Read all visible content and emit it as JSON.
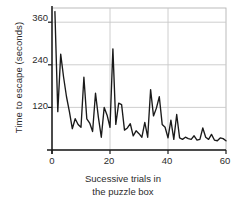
{
  "chart_data": {
    "type": "line",
    "title": "",
    "xlabel": "Sucessive trials in the puzzle box",
    "xlabel_line1": "Sucessive trials in",
    "xlabel_line2": "the puzzle box",
    "ylabel": "Time to escape (seconds)",
    "xlim": [
      0,
      60
    ],
    "ylim": [
      0,
      400
    ],
    "xticks": [
      0,
      20,
      40,
      60
    ],
    "yticks": [
      120,
      240,
      360
    ],
    "xtick_labels": [
      "0",
      "20",
      "40",
      "60"
    ],
    "ytick_labels": [
      "120",
      "240",
      "360"
    ],
    "grid": true,
    "legend": false,
    "line_color": "#1a1a1a",
    "grid_color": "#c8c8c8",
    "axis_color": "#1a1a1a",
    "frame_color": "#b4b4b4",
    "text_color": "#2b2b2b",
    "series": [
      {
        "name": "Time to escape",
        "x": [
          1,
          2,
          3,
          4,
          5,
          6,
          7,
          8,
          9,
          10,
          11,
          12,
          13,
          14,
          15,
          16,
          17,
          18,
          19,
          20,
          21,
          22,
          23,
          24,
          25,
          26,
          27,
          28,
          29,
          30,
          31,
          32,
          33,
          34,
          35,
          36,
          37,
          38,
          39,
          40,
          41,
          42,
          43,
          44,
          45,
          46,
          47,
          48,
          49,
          50,
          51,
          52,
          53,
          54,
          55,
          56,
          57,
          58,
          59,
          60
        ],
        "values": [
          390,
          108,
          270,
          205,
          150,
          108,
          60,
          88,
          72,
          64,
          205,
          88,
          76,
          52,
          160,
          92,
          36,
          120,
          98,
          64,
          285,
          72,
          132,
          128,
          56,
          62,
          74,
          40,
          54,
          46,
          36,
          78,
          36,
          170,
          96,
          118,
          150,
          72,
          64,
          34,
          84,
          30,
          100,
          34,
          30,
          36,
          32,
          30,
          40,
          28,
          30,
          62,
          36,
          30,
          44,
          28,
          26,
          34,
          32,
          26
        ]
      }
    ]
  }
}
